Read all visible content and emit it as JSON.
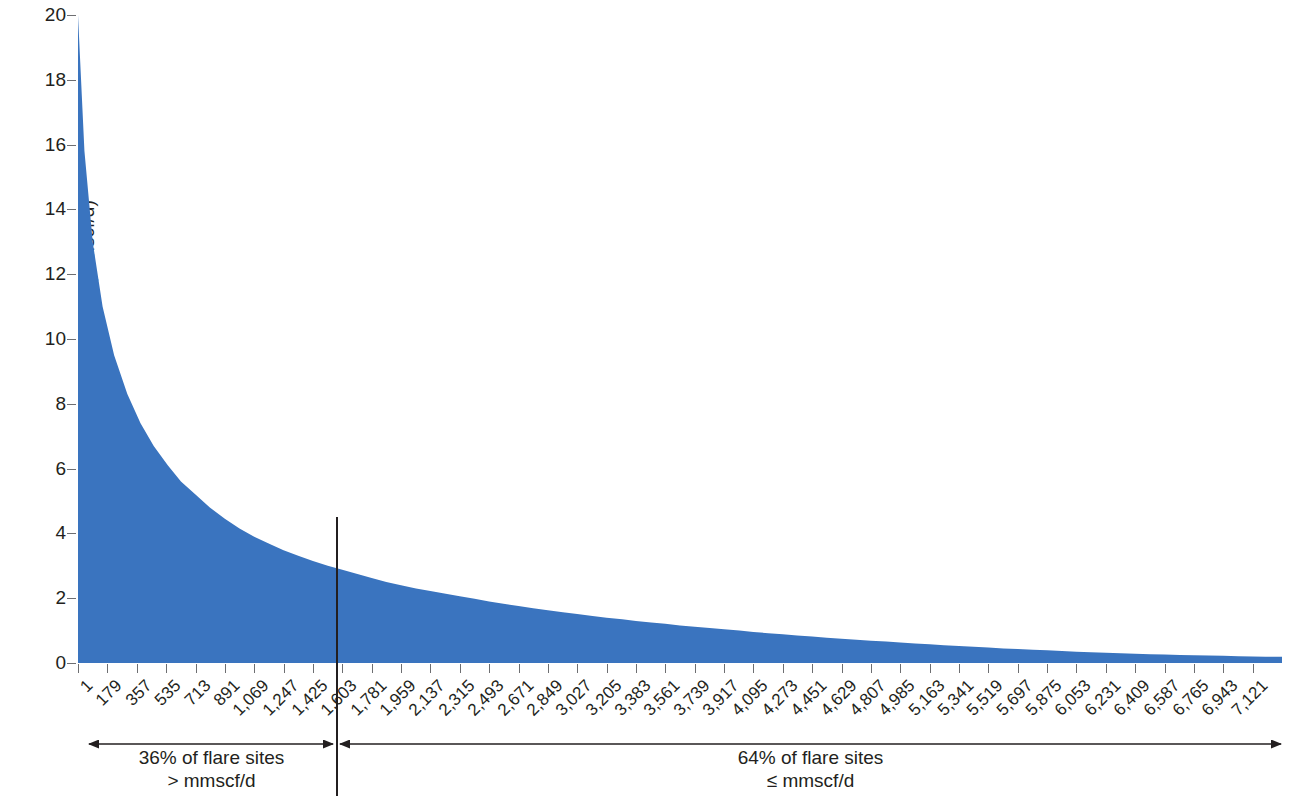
{
  "chart_data": {
    "type": "area",
    "title": "",
    "xlabel": "",
    "ylabel": "Volume of gas flared (mmscf/d)",
    "ylim": [
      0,
      20
    ],
    "ytick_values": [
      0,
      2,
      4,
      6,
      8,
      10,
      12,
      14,
      16,
      18,
      20
    ],
    "ytick_labels": [
      "0",
      "2",
      "4",
      "6",
      "8",
      "10",
      "12",
      "14",
      "16",
      "18",
      "20"
    ],
    "xlim": [
      1,
      7299
    ],
    "xtick_labels": [
      "1",
      "179",
      "357",
      "535",
      "713",
      "891",
      "1,069",
      "1,247",
      "1,425",
      "1,603",
      "1,781",
      "1,959",
      "2,137",
      "2,315",
      "2,493",
      "2,671",
      "2,849",
      "3,027",
      "3,205",
      "3,383",
      "3,561",
      "3,739",
      "3,917",
      "4,095",
      "4,273",
      "4,451",
      "4,629",
      "4,807",
      "4,985",
      "5,163",
      "5,341",
      "5,519",
      "5,697",
      "5,875",
      "6,053",
      "6,231",
      "6,409",
      "6,587",
      "6,765",
      "6,943",
      "7,121"
    ],
    "xtick_values": [
      1,
      179,
      357,
      535,
      713,
      891,
      1069,
      1247,
      1425,
      1603,
      1781,
      1959,
      2137,
      2315,
      2493,
      2671,
      2849,
      3027,
      3205,
      3383,
      3561,
      3739,
      3917,
      4095,
      4273,
      4451,
      4629,
      4807,
      4985,
      5163,
      5341,
      5519,
      5697,
      5875,
      6053,
      6231,
      6409,
      6587,
      6765,
      6943,
      7121
    ],
    "grid": false,
    "legend": "none",
    "series_color": "#3a74bf",
    "series": [
      {
        "name": "Volume of gas flared per flare site (rank ordered)",
        "x": [
          1,
          40,
          90,
          150,
          220,
          300,
          380,
          460,
          545,
          625,
          713,
          800,
          891,
          980,
          1069,
          1160,
          1247,
          1340,
          1425,
          1515,
          1603,
          1700,
          1781,
          1870,
          1959,
          2050,
          2137,
          2230,
          2315,
          2405,
          2493,
          2580,
          2671,
          2760,
          2849,
          2940,
          3027,
          3120,
          3205,
          3300,
          3383,
          3475,
          3561,
          3650,
          3739,
          3830,
          3917,
          4010,
          4095,
          4185,
          4273,
          4360,
          4451,
          4540,
          4629,
          4720,
          4807,
          4900,
          4985,
          5075,
          5163,
          5250,
          5341,
          5430,
          5519,
          5610,
          5697,
          5790,
          5875,
          5965,
          6053,
          6140,
          6231,
          6320,
          6409,
          6500,
          6587,
          6680,
          6765,
          6855,
          6943,
          7035,
          7121,
          7200,
          7299
        ],
        "y": [
          20.0,
          15.8,
          13.0,
          11.0,
          9.5,
          8.3,
          7.4,
          6.7,
          6.1,
          5.6,
          5.2,
          4.8,
          4.45,
          4.15,
          3.9,
          3.68,
          3.48,
          3.3,
          3.15,
          3.0,
          2.88,
          2.74,
          2.62,
          2.5,
          2.4,
          2.3,
          2.22,
          2.14,
          2.06,
          1.98,
          1.9,
          1.83,
          1.76,
          1.69,
          1.63,
          1.57,
          1.51,
          1.45,
          1.4,
          1.35,
          1.3,
          1.25,
          1.21,
          1.16,
          1.12,
          1.08,
          1.04,
          1.0,
          0.96,
          0.92,
          0.89,
          0.85,
          0.82,
          0.78,
          0.75,
          0.72,
          0.69,
          0.66,
          0.63,
          0.6,
          0.575,
          0.55,
          0.525,
          0.5,
          0.475,
          0.45,
          0.43,
          0.41,
          0.39,
          0.37,
          0.35,
          0.33,
          0.315,
          0.3,
          0.285,
          0.27,
          0.26,
          0.25,
          0.24,
          0.23,
          0.22,
          0.21,
          0.2,
          0.195,
          0.19
        ]
      }
    ],
    "annotations": [
      {
        "id": "left-segment",
        "line1": "36% of flare sites",
        "line2": "> mmscf/d",
        "x_start": 1,
        "x_end": 1603
      },
      {
        "id": "right-segment",
        "line1": "64% of flare sites",
        "line2": "≤ mmscf/d",
        "x_start": 1603,
        "x_end": 7299
      }
    ],
    "divider": {
      "label": "split-line",
      "x_value": 1603,
      "y_value": 2.0,
      "color": "#231f20"
    }
  }
}
